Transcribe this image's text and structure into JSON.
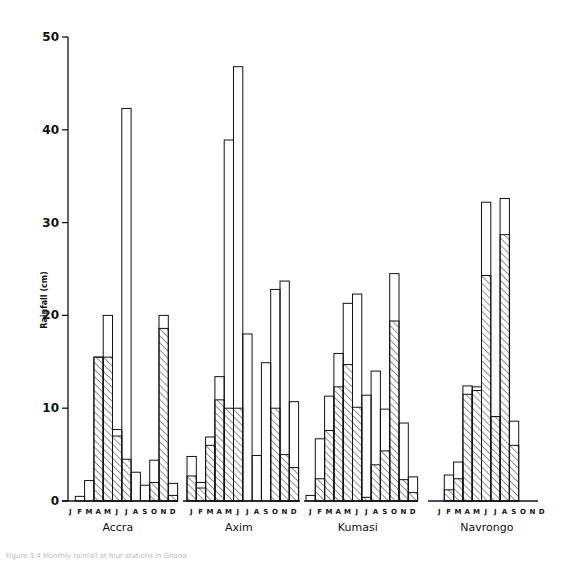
{
  "chart_data": {
    "type": "bar",
    "title": "",
    "xlabel": "",
    "ylabel": "Rainfall (cm)",
    "ylim": [
      0,
      50
    ],
    "yticks": [
      0,
      10,
      20,
      30,
      40,
      50
    ],
    "grid": false,
    "legend": "none",
    "bar_style": "stacked outline; lower segment hatched, upper segment open (bar height = total)",
    "categories": [
      "J",
      "F",
      "M",
      "A",
      "M",
      "J",
      "J",
      "A",
      "S",
      "O",
      "N",
      "D"
    ],
    "panels": [
      {
        "name": "Accra",
        "total": [
          0,
          0.5,
          2.2,
          15.5,
          20.0,
          7.7,
          42.3,
          3.1,
          1.7,
          4.4,
          20.0,
          1.9
        ],
        "hatched": [
          0,
          0,
          0,
          15.5,
          15.5,
          7.0,
          4.5,
          0,
          0,
          2.0,
          18.6,
          0.6
        ]
      },
      {
        "name": "Axim",
        "total": [
          4.8,
          2.0,
          6.9,
          13.4,
          38.9,
          46.8,
          18.0,
          4.9,
          14.9,
          22.8,
          23.7,
          10.7
        ],
        "hatched": [
          2.7,
          1.4,
          6.0,
          10.9,
          10.0,
          10.0,
          0,
          0,
          0,
          10.0,
          5.0,
          3.6
        ]
      },
      {
        "name": "Kumasi",
        "total": [
          0.6,
          6.7,
          11.3,
          15.9,
          21.3,
          22.3,
          11.4,
          14.0,
          9.9,
          24.5,
          8.4,
          2.6
        ],
        "hatched": [
          0,
          2.4,
          7.6,
          12.3,
          14.7,
          10.1,
          0.4,
          3.9,
          5.4,
          19.4,
          2.3,
          0.9
        ]
      },
      {
        "name": "Navrongo",
        "total": [
          0,
          2.8,
          4.2,
          12.4,
          12.3,
          32.2,
          9.1,
          32.6,
          8.6,
          0,
          0,
          0
        ],
        "hatched": [
          0,
          1.2,
          2.4,
          11.5,
          11.9,
          24.3,
          9.1,
          28.7,
          6.0,
          0,
          0,
          0
        ]
      }
    ]
  },
  "axis": {
    "ylabel": "Rainfall (cm)",
    "ticks": [
      "0",
      "10",
      "20",
      "30",
      "40",
      "50"
    ]
  },
  "caption": "Figure 3.4  Monthly rainfall at four stations in Ghana"
}
